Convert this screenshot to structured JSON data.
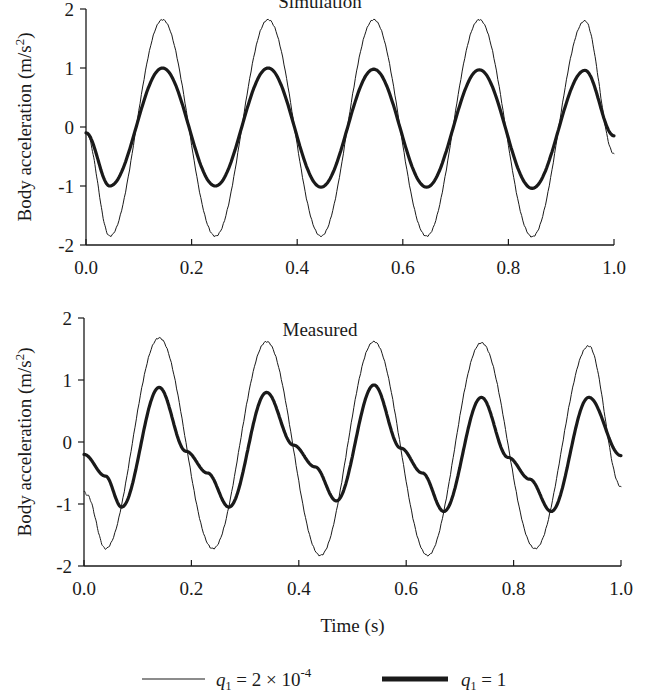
{
  "chart_data": [
    {
      "type": "line",
      "title": "Simulation",
      "xlabel": "",
      "ylabel": "Body acceleration (m/s²)",
      "xlim": [
        0.0,
        1.0
      ],
      "ylim": [
        -2,
        2
      ],
      "xticks": [
        "0.0",
        "0.2",
        "0.4",
        "0.6",
        "0.8",
        "1.0"
      ],
      "yticks": [
        "2",
        "1",
        "0",
        "-1",
        "-2"
      ],
      "grid": false,
      "series": [
        {
          "name": "q1 = 2 × 10^-4",
          "style": "thin",
          "frequency_hz": 5,
          "x": [
            0.0,
            0.045,
            0.145,
            0.245,
            0.345,
            0.445,
            0.545,
            0.645,
            0.745,
            0.845,
            0.945,
            1.0
          ],
          "values": [
            -0.1,
            -1.85,
            1.82,
            -1.85,
            1.82,
            -1.85,
            1.82,
            -1.85,
            1.82,
            -1.86,
            1.8,
            -0.45
          ]
        },
        {
          "name": "q1 = 1",
          "style": "thick",
          "frequency_hz": 5,
          "x": [
            0.0,
            0.045,
            0.145,
            0.245,
            0.345,
            0.445,
            0.545,
            0.645,
            0.745,
            0.845,
            0.945,
            1.0
          ],
          "values": [
            -0.1,
            -1.0,
            1.0,
            -1.0,
            1.0,
            -1.02,
            0.98,
            -1.02,
            0.97,
            -1.04,
            0.96,
            -0.15
          ]
        }
      ]
    },
    {
      "type": "line",
      "title": "Measured",
      "xlabel": "Time (s)",
      "ylabel": "Body acceleration (m/s²)",
      "xlim": [
        0.0,
        1.0
      ],
      "ylim": [
        -2,
        2
      ],
      "xticks": [
        "0.0",
        "0.2",
        "0.4",
        "0.6",
        "0.8",
        "1.0"
      ],
      "yticks": [
        "2",
        "1",
        "0",
        "-1",
        "-2"
      ],
      "grid": false,
      "series": [
        {
          "name": "q1 = 2 × 10^-4",
          "style": "thin",
          "x": [
            0.0,
            0.005,
            0.04,
            0.14,
            0.24,
            0.34,
            0.44,
            0.54,
            0.64,
            0.74,
            0.84,
            0.94,
            1.0
          ],
          "values": [
            -0.8,
            -0.85,
            -1.72,
            1.68,
            -1.72,
            1.62,
            -1.83,
            1.62,
            -1.83,
            1.6,
            -1.72,
            1.55,
            -0.72
          ]
        },
        {
          "name": "q1 = 1",
          "style": "thick",
          "x": [
            0.0,
            0.04,
            0.07,
            0.14,
            0.19,
            0.23,
            0.27,
            0.34,
            0.39,
            0.43,
            0.47,
            0.54,
            0.59,
            0.63,
            0.67,
            0.74,
            0.79,
            0.83,
            0.87,
            0.94,
            1.0
          ],
          "values": [
            -0.2,
            -0.55,
            -1.05,
            0.88,
            -0.15,
            -0.5,
            -1.05,
            0.8,
            -0.05,
            -0.4,
            -0.95,
            0.92,
            -0.1,
            -0.5,
            -1.12,
            0.72,
            -0.25,
            -0.6,
            -1.12,
            0.72,
            -0.22
          ]
        }
      ]
    }
  ],
  "legend": {
    "position": "bottom",
    "items": [
      {
        "label_var": "q",
        "label_sub": "1",
        "label_rest": " = 2 × 10",
        "label_sup": "-4",
        "style": "thin"
      },
      {
        "label_var": "q",
        "label_sub": "1",
        "label_rest": " = 1",
        "style": "thick"
      }
    ]
  },
  "colors": {
    "line": "#1a1a1a",
    "axis": "#1a1a1a",
    "background": "#ffffff"
  }
}
